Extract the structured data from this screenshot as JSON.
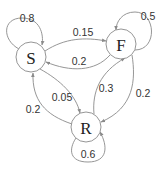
{
  "diagram": {
    "type": "state-transition",
    "nodes": [
      {
        "id": "S",
        "label": "S",
        "cx": 31,
        "cy": 57,
        "r": 15
      },
      {
        "id": "F",
        "label": "F",
        "cx": 121,
        "cy": 44,
        "r": 15
      },
      {
        "id": "R",
        "label": "R",
        "cx": 86,
        "cy": 127,
        "r": 15
      }
    ],
    "edges": [
      {
        "from": "S",
        "to": "S",
        "label": "0.8",
        "lx": 27,
        "ly": 18
      },
      {
        "from": "S",
        "to": "F",
        "label": "0.15",
        "lx": 83,
        "ly": 32
      },
      {
        "from": "F",
        "to": "S",
        "label": "0.2",
        "lx": 79,
        "ly": 61
      },
      {
        "from": "F",
        "to": "F",
        "label": "0.5",
        "lx": 148,
        "ly": 16
      },
      {
        "from": "S",
        "to": "R",
        "label": "0.05",
        "lx": 62,
        "ly": 97
      },
      {
        "from": "R",
        "to": "S",
        "label": "0.2",
        "lx": 33,
        "ly": 109
      },
      {
        "from": "R",
        "to": "F",
        "label": "0.3",
        "lx": 106,
        "ly": 88
      },
      {
        "from": "F",
        "to": "R",
        "label": "0.2",
        "lx": 143,
        "ly": 93
      },
      {
        "from": "R",
        "to": "R",
        "label": "0.6",
        "lx": 88,
        "ly": 154
      }
    ],
    "colors": {
      "stroke": "#8a8a8a",
      "text": "#333333",
      "background": "#ffffff"
    }
  }
}
